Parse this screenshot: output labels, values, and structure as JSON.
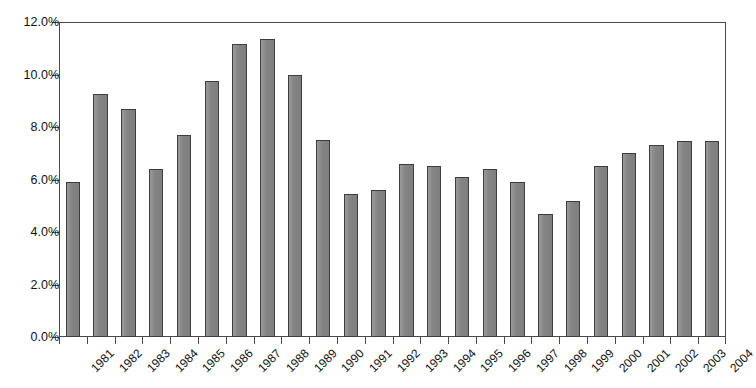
{
  "chart_data": {
    "type": "bar",
    "title": "",
    "title_note": "title cropped off at top edge of screenshot (illegible)",
    "xlabel": "",
    "ylabel": "",
    "categories": [
      "1981",
      "1982",
      "1983",
      "1984",
      "1985",
      "1986",
      "1987",
      "1988",
      "1989",
      "1990",
      "1991",
      "1992",
      "1993",
      "1994",
      "1995",
      "1996",
      "1997",
      "1998",
      "1999",
      "2000",
      "2001",
      "2002",
      "2003",
      "2004"
    ],
    "values": [
      5.9,
      9.25,
      8.7,
      6.4,
      7.7,
      9.75,
      11.15,
      11.35,
      10.0,
      7.5,
      5.45,
      5.6,
      6.6,
      6.5,
      6.1,
      6.4,
      5.9,
      4.7,
      5.2,
      6.5,
      7.0,
      7.3,
      7.45,
      7.45
    ],
    "ylim": [
      0,
      12
    ],
    "ytick_values": [
      0,
      2,
      4,
      6,
      8,
      10,
      12
    ],
    "ytick_labels": [
      "0.0%",
      "2.0%",
      "4.0%",
      "6.0%",
      "8.0%",
      "10.0%",
      "12.0%"
    ],
    "grid": false,
    "legend": null,
    "legend_position": "none",
    "series_color": "#8a8a8a",
    "series_edge_color": "#3d3d3d",
    "axis_color": "#4a4a4a",
    "xtick_rotation": -45
  }
}
